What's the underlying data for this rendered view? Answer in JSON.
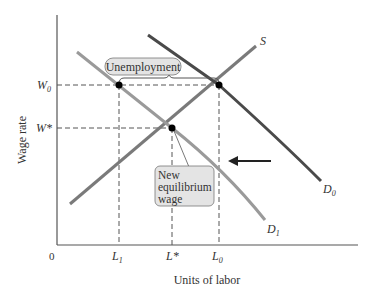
{
  "diagram": {
    "y_axis_label": "Wage rate",
    "x_axis_label": "Units of labor",
    "origin_label": "0",
    "y_ticks": [
      {
        "main": "W",
        "sub": "0"
      },
      {
        "main": "W*",
        "sub": ""
      }
    ],
    "x_ticks": [
      {
        "main": "L",
        "sub": "1"
      },
      {
        "main": "L*",
        "sub": ""
      },
      {
        "main": "L",
        "sub": "0"
      }
    ],
    "curves": {
      "supply": {
        "main": "S",
        "sub": ""
      },
      "demand_initial": {
        "main": "D",
        "sub": "0"
      },
      "demand_new": {
        "main": "D",
        "sub": "1"
      }
    },
    "callouts": {
      "unemployment": "Unemployment",
      "new_equilibrium_line1": "New",
      "new_equilibrium_line2": "equilibrium",
      "new_equilibrium_line3": "wage"
    },
    "colors": {
      "supply": "#7a7a7a",
      "demand_initial": "#4a4a4a",
      "demand_new": "#9a9a9a",
      "callout_fill": "#e4e4e4",
      "axis": "#555555"
    }
  }
}
